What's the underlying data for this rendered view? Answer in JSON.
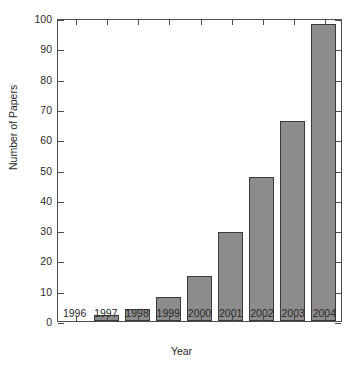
{
  "chart_data": {
    "type": "bar",
    "title": "",
    "xlabel": "Year",
    "ylabel": "Number of Papers",
    "categories": [
      "1996",
      "1997",
      "1998",
      "1999",
      "2000",
      "2001",
      "2002",
      "2003",
      "2004"
    ],
    "values": [
      0,
      2,
      4,
      8,
      15,
      29.5,
      47.5,
      66,
      98
    ],
    "ylim": [
      0,
      100
    ],
    "yticks": [
      0,
      10,
      20,
      30,
      40,
      50,
      60,
      70,
      80,
      90,
      100
    ],
    "ytick_labels": [
      "0",
      "10",
      "20",
      "30",
      "40",
      "50",
      "60",
      "70",
      "80",
      "90",
      "100"
    ],
    "grid": false,
    "legend": null,
    "bar_color": "#8c8c8c",
    "bar_edge_color": "#3a3a3a",
    "axis_color": "#4d4d4d",
    "background_color": "#ffffff"
  }
}
